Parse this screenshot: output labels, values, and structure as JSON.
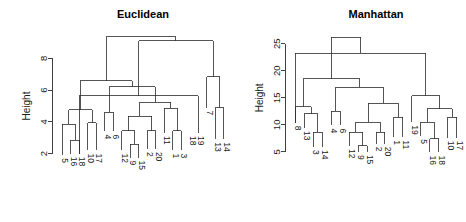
{
  "figure": {
    "background": "#ffffff",
    "line_color": "#2b2b2b",
    "text_color": "#1a1a1a",
    "width": 466,
    "height": 222
  },
  "chart_data": [
    {
      "type": "dendrogram",
      "title": "Euclidean",
      "xlabel": "",
      "ylabel": "Height",
      "ylim": [
        1.6,
        9.6
      ],
      "yticks": [
        2,
        4,
        6,
        8
      ],
      "ytick_labels": [
        "2",
        "4",
        "6",
        "8"
      ],
      "grid": false,
      "legend": "none",
      "leaf_order": [
        "5",
        "16",
        "18",
        "10",
        "17",
        "4",
        "6",
        "12",
        "9",
        "15",
        "2",
        "20",
        "11",
        "1",
        "3",
        "18",
        "19",
        "7",
        "13",
        "14"
      ],
      "leaf_labels": [
        "5",
        "16",
        "18",
        "10",
        "17",
        "4",
        "6",
        "12",
        "9",
        "15",
        "2",
        "20",
        "11",
        "1",
        "3",
        "18",
        "19",
        "7",
        "13",
        "14"
      ],
      "leaf_heights": [
        1.9,
        2.0,
        2.0,
        2.2,
        2.2,
        3.4,
        3.4,
        2.2,
        1.75,
        1.75,
        2.3,
        2.3,
        3.3,
        2.2,
        2.2,
        3.3,
        3.3,
        4.9,
        2.9,
        2.9
      ],
      "merges": [
        {
          "id": "m1",
          "left": "16",
          "right": "18",
          "height": 2.85
        },
        {
          "id": "m2",
          "left": "5",
          "right": "m1",
          "height": 3.85
        },
        {
          "id": "m3",
          "left": "10",
          "right": "17",
          "height": 3.95
        },
        {
          "id": "m4",
          "left": "m2",
          "right": "m3",
          "height": 4.75
        },
        {
          "id": "m5",
          "left": "4",
          "right": "6",
          "height": 4.6
        },
        {
          "id": "m6",
          "left": "9",
          "right": "15",
          "height": 2.6
        },
        {
          "id": "m7",
          "left": "12",
          "right": "m6",
          "height": 3.45
        },
        {
          "id": "m8",
          "left": "2",
          "right": "20",
          "height": 3.45
        },
        {
          "id": "m9",
          "left": "m7",
          "right": "m8",
          "height": 4.35
        },
        {
          "id": "m10",
          "left": "1",
          "right": "3",
          "height": 3.45
        },
        {
          "id": "m11",
          "left": "11",
          "right": "m10",
          "height": 4.85
        },
        {
          "id": "m12",
          "left": "m9",
          "right": "m11",
          "height": 5.25
        },
        {
          "id": "m13",
          "left": "m5",
          "right": "m12",
          "height": 6.2
        },
        {
          "id": "m14",
          "left": "m4",
          "right": "m13",
          "height": 6.6
        },
        {
          "id": "m15",
          "left": "18",
          "right": "19",
          "height": 5.65
        },
        {
          "id": "m16",
          "left": "13",
          "right": "14",
          "height": 4.9
        },
        {
          "id": "m17",
          "left": "7",
          "right": "m16",
          "height": 6.85
        },
        {
          "id": "m18",
          "left": "m15",
          "right": "m17",
          "height": 9.1
        },
        {
          "id": "m19",
          "left": "m14",
          "right": "m18",
          "height": 9.35
        }
      ]
    },
    {
      "type": "dendrogram",
      "title": "Manhattan",
      "xlabel": "",
      "ylabel": "Height",
      "ylim": [
        3.5,
        27.0
      ],
      "yticks": [
        5,
        10,
        15,
        20,
        25
      ],
      "ytick_labels": [
        "5",
        "10",
        "15",
        "20",
        "25"
      ],
      "grid": false,
      "legend": "none",
      "leaf_order": [
        "8",
        "13",
        "3",
        "14",
        "4",
        "6",
        "12",
        "9",
        "15",
        "2",
        "20",
        "1",
        "11",
        "19",
        "5",
        "16",
        "18",
        "10",
        "17"
      ],
      "leaf_labels": [
        "8",
        "13",
        "3",
        "14",
        "4",
        "6",
        "12",
        "9",
        "15",
        "2",
        "20",
        "1",
        "11",
        "19",
        "5",
        "16",
        "18",
        "10",
        "17"
      ],
      "leaf_heights": [
        10.4,
        9.4,
        5.9,
        5.9,
        9.9,
        9.9,
        6.1,
        5.0,
        5.0,
        6.5,
        6.5,
        7.7,
        7.7,
        10.5,
        7.9,
        4.9,
        4.9,
        7.6,
        7.6
      ],
      "merges": [
        {
          "id": "n1",
          "left": "3",
          "right": "14",
          "height": 8.6
        },
        {
          "id": "n2",
          "left": "13",
          "right": "n1",
          "height": 12.1
        },
        {
          "id": "n3",
          "left": "8",
          "right": "n2",
          "height": 13.4
        },
        {
          "id": "n4",
          "left": "4",
          "right": "6",
          "height": 12.5
        },
        {
          "id": "n5",
          "left": "9",
          "right": "15",
          "height": 6.1
        },
        {
          "id": "n6",
          "left": "12",
          "right": "n5",
          "height": 8.6
        },
        {
          "id": "n7",
          "left": "2",
          "right": "20",
          "height": 8.6
        },
        {
          "id": "n8",
          "left": "n6",
          "right": "n7",
          "height": 10.5
        },
        {
          "id": "n9",
          "left": "1",
          "right": "11",
          "height": 11.4
        },
        {
          "id": "n10",
          "left": "n8",
          "right": "n9",
          "height": 14.0
        },
        {
          "id": "n11",
          "left": "n4",
          "right": "n10",
          "height": 17.0
        },
        {
          "id": "n12",
          "left": "n3",
          "right": "n11",
          "height": 18.5
        },
        {
          "id": "n13",
          "left": "16",
          "right": "18",
          "height": 7.4
        },
        {
          "id": "n14",
          "left": "5",
          "right": "n13",
          "height": 10.5
        },
        {
          "id": "n15",
          "left": "10",
          "right": "17",
          "height": 11.4
        },
        {
          "id": "n16",
          "left": "n14",
          "right": "n15",
          "height": 13.0
        },
        {
          "id": "n17",
          "left": "19",
          "right": "n16",
          "height": 15.4
        },
        {
          "id": "n18",
          "left": "7",
          "right": "n17",
          "height": 23.3
        },
        {
          "id": "n19",
          "left": "n12",
          "right": "n18",
          "height": 26.2
        }
      ]
    }
  ]
}
